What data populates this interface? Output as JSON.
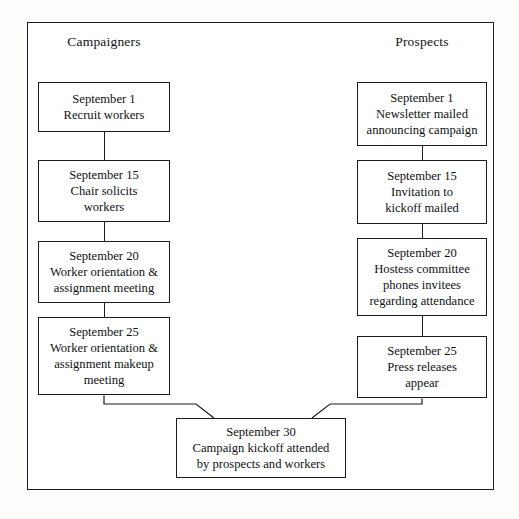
{
  "diagram": {
    "columns": [
      {
        "id": "campaigners",
        "label": "Campaigners"
      },
      {
        "id": "prospects",
        "label": "Prospects"
      }
    ],
    "colors": {
      "line": "#1c1c1c",
      "text": "#111111",
      "background": "#ffffff"
    },
    "left_nodes": [
      {
        "date": "September 1",
        "line2": "Recruit workers",
        "line3": "",
        "line4": ""
      },
      {
        "date": "September 15",
        "line2": "Chair solicits",
        "line3": "workers",
        "line4": ""
      },
      {
        "date": "September 20",
        "line2": "Worker orientation &",
        "line3": "assignment meeting",
        "line4": ""
      },
      {
        "date": "September 25",
        "line2": "Worker orientation &",
        "line3": "assignment makeup",
        "line4": "meeting"
      }
    ],
    "right_nodes": [
      {
        "date": "September 1",
        "line2": "Newsletter mailed",
        "line3": "announcing campaign",
        "line4": ""
      },
      {
        "date": "September 15",
        "line2": "Invitation to",
        "line3": "kickoff mailed",
        "line4": ""
      },
      {
        "date": "September 20",
        "line2": "Hostess committee",
        "line3": "phones invitees",
        "line4": "regarding attendance"
      },
      {
        "date": "September 25",
        "line2": "Press releases",
        "line3": "appear",
        "line4": ""
      }
    ],
    "merge_node": {
      "date": "September 30",
      "line2": "Campaign kickoff attended",
      "line3": "by prospects and workers"
    }
  }
}
